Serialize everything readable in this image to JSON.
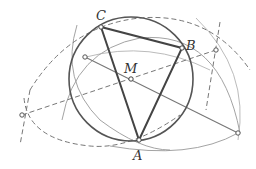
{
  "diagram": {
    "type": "geometric-construction",
    "colors": {
      "circle": "#555555",
      "triangle": "#444444",
      "construction": "#888888",
      "dashed": "#777777",
      "background": "#ffffff"
    },
    "points": [
      {
        "id": "A",
        "label": "A",
        "x": 139,
        "y": 140,
        "label_x": 133,
        "label_y": 160
      },
      {
        "id": "B",
        "label": "B",
        "x": 182,
        "y": 48,
        "label_x": 186,
        "label_y": 48
      },
      {
        "id": "C",
        "label": "C",
        "x": 101,
        "y": 27,
        "label_x": 96,
        "label_y": 19
      },
      {
        "id": "M",
        "label": "M",
        "x": 131,
        "y": 79,
        "label_x": 126,
        "label_y": 73
      }
    ],
    "construction_points": [
      {
        "id": "P1",
        "x": 85,
        "y": 57
      },
      {
        "id": "P2",
        "x": 22,
        "y": 115
      },
      {
        "id": "P3",
        "x": 216,
        "y": 50
      },
      {
        "id": "P4",
        "x": 238,
        "y": 133
      }
    ],
    "circle": {
      "cx": 131,
      "cy": 79,
      "r": 62
    },
    "labels": {
      "A": "A",
      "B": "B",
      "C": "C",
      "M": "M"
    }
  }
}
